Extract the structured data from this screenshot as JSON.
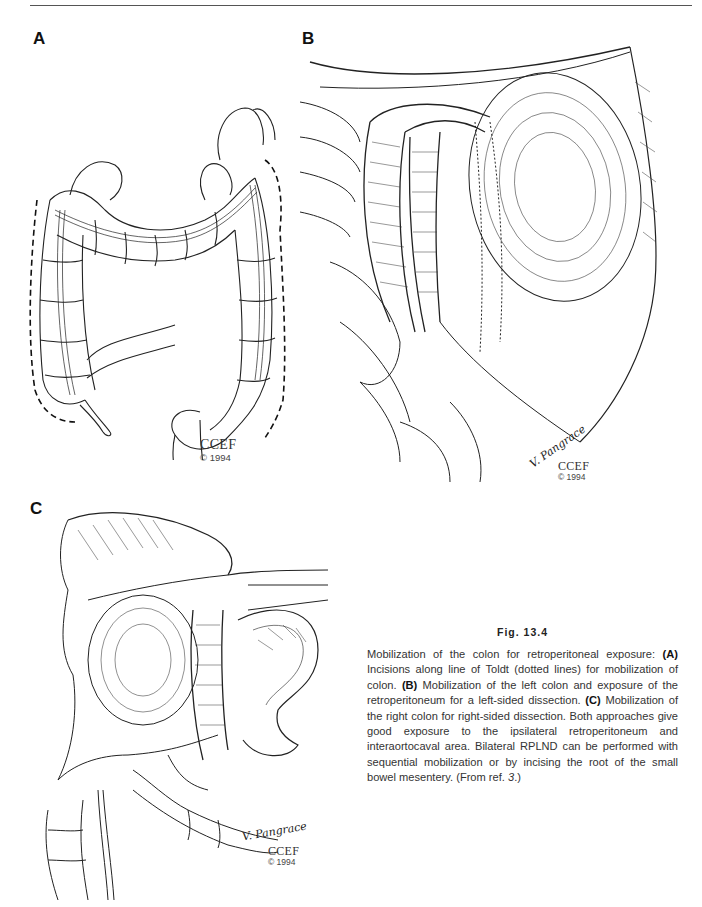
{
  "page": {
    "header_rule": true
  },
  "panels": {
    "a": {
      "label": "A",
      "description": "Colon with dotted lines along line of Toldt",
      "credit_org": "CCEF",
      "credit_year": "© 1994"
    },
    "b": {
      "label": "B",
      "description": "Mobilized left colon exposing retroperitoneum",
      "signature": "V. Pangrace",
      "credit_org": "CCEF",
      "credit_year": "© 1994"
    },
    "c": {
      "label": "C",
      "description": "Mobilized right colon for right-sided dissection",
      "signature": "V. Pangrace",
      "credit_org": "CCEF",
      "credit_year": "© 1994"
    }
  },
  "caption": {
    "title": "Fig. 13.4",
    "segments": [
      {
        "text": "Mobilization of the colon for retroperitoneal exposure: ",
        "style": "normal"
      },
      {
        "text": "(A)",
        "style": "bold"
      },
      {
        "text": " Incisions along line of Toldt (dotted lines) for mobilization of colon. ",
        "style": "normal"
      },
      {
        "text": "(B)",
        "style": "bold"
      },
      {
        "text": " Mobilization of the left colon and exposure of the retroperitoneum for a left-sided dissection. ",
        "style": "normal"
      },
      {
        "text": "(C)",
        "style": "bold"
      },
      {
        "text": " Mobilization of the right colon for right-sided dissection. Both approaches give good exposure to the ipsilateral retroperitoneum and interaortocaval area. Bilateral RPLND can be performed with sequential mobilization or by incising the root of the small bowel mesentery. (From ref. ",
        "style": "normal"
      },
      {
        "text": "3",
        "style": "italic"
      },
      {
        "text": ".)",
        "style": "normal"
      }
    ]
  }
}
